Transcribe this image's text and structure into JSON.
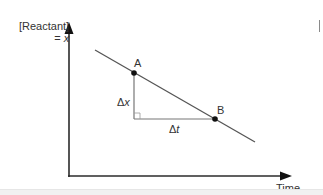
{
  "diagram": {
    "y_axis": {
      "label_line1": "[Reactant]",
      "label_line2_prefix": "= ",
      "label_line2_var": "x"
    },
    "x_axis": {
      "label": "Time"
    },
    "points": [
      {
        "name": "A",
        "x": 134,
        "y": 73
      },
      {
        "name": "B",
        "x": 215,
        "y": 119
      }
    ],
    "line": {
      "x1": 95,
      "y1": 50,
      "x2": 255,
      "y2": 142
    },
    "triangle": {
      "vertical_label_delta": "Δ",
      "vertical_label_var": "x",
      "horizontal_label_delta": "Δ",
      "horizontal_label_var": "t"
    },
    "colors": {
      "axis": "#2b2b2b",
      "line": "#555555",
      "triangle": "#777777",
      "point": "#111111",
      "text": "#333333"
    }
  }
}
